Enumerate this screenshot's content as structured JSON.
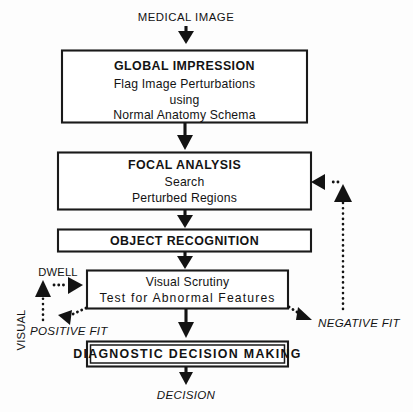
{
  "diagram": {
    "colors": {
      "ink": "#131313",
      "paper": "#fdfdfd",
      "box_fill": "#ffffff"
    },
    "input_label": "MEDICAL IMAGE",
    "output_label": "DECISION",
    "boxes": [
      {
        "id": "global-impression",
        "heading": "GLOBAL IMPRESSION",
        "lines": [
          "Flag  Image  Perturbations",
          "using",
          "Normal Anatomy Schema"
        ]
      },
      {
        "id": "focal-analysis",
        "heading": "FOCAL ANALYSIS",
        "lines": [
          "Search",
          "Perturbed Regions"
        ]
      },
      {
        "id": "object-recognition",
        "heading": "OBJECT RECOGNITION",
        "lines": []
      },
      {
        "id": "visual-scrutiny",
        "heading": "",
        "lines": [
          "Visual Scrutiny",
          "Test for Abnormal Features"
        ]
      },
      {
        "id": "diagnostic-decision-making",
        "heading": "DIAGNOSTIC  DECISION  MAKING",
        "lines": []
      }
    ],
    "edge_labels": {
      "dwell": "DWELL",
      "visual": "VISUAL",
      "positive_fit": "POSITIVE FIT",
      "negative_fit": "NEGATIVE FIT"
    }
  }
}
